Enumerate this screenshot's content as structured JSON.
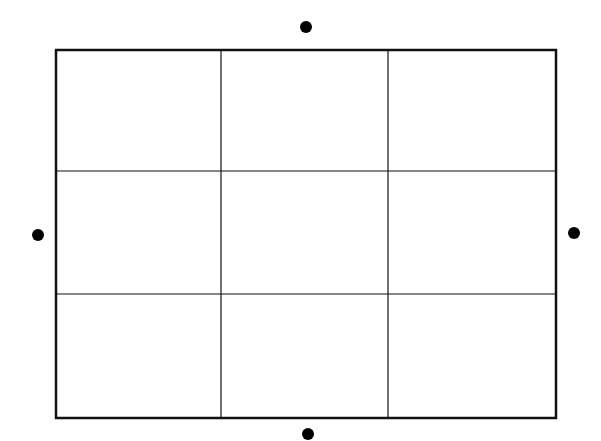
{
  "diagram": {
    "type": "grid-with-external-points",
    "rows": 3,
    "cols": 3,
    "colors": {
      "line": "#111111",
      "dot": "#000000",
      "background": "#ffffff"
    },
    "grid": {
      "left": 56,
      "top": 50,
      "right": 556,
      "bottom": 418,
      "col_dividers_x": [
        221,
        388
      ],
      "row_dividers_y": [
        171,
        294
      ],
      "outer_stroke_width": 2.5,
      "inner_stroke_width": 1.2
    },
    "points": [
      {
        "id": "top",
        "cx": 306,
        "cy": 27,
        "r": 6
      },
      {
        "id": "left",
        "cx": 38,
        "cy": 235,
        "r": 6
      },
      {
        "id": "right",
        "cx": 574,
        "cy": 233,
        "r": 6
      },
      {
        "id": "bottom",
        "cx": 308,
        "cy": 434,
        "r": 6
      }
    ]
  }
}
